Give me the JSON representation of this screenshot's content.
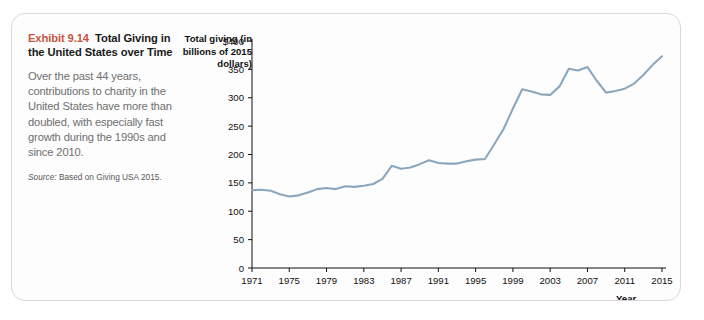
{
  "exhibit": {
    "number": "Exhibit 9.14",
    "title": "Total Giving in the United States over Time",
    "description": "Over the past 44 years, contributions to charity in the United States have more than doubled, with especially fast growth during the 1990s and since 2010.",
    "source_label": "Source:",
    "source_text": " Based on Giving USA 2015."
  },
  "axis_titles": {
    "y": "Total giving (in billions of 2015 dollars)",
    "x": "Year"
  },
  "bleed_text": [
    "9.7 Common Pool Resource Goods"
  ],
  "chart_data": {
    "type": "line",
    "title": "Total Giving in the United States over Time",
    "xlabel": "Year",
    "ylabel": "Total giving (in billions of 2015 dollars)",
    "xlim": [
      1971,
      2015
    ],
    "ylim": [
      0,
      400
    ],
    "ytick_labels": [
      "$400",
      "350",
      "300",
      "250",
      "200",
      "150",
      "100",
      "50",
      "0"
    ],
    "yticks": [
      400,
      350,
      300,
      250,
      200,
      150,
      100,
      50,
      0
    ],
    "xticks": [
      1971,
      1975,
      1979,
      1983,
      1987,
      1991,
      1995,
      1999,
      2003,
      2007,
      2011,
      2015
    ],
    "grid": false,
    "legend": false,
    "line_color": "#8ba6bd",
    "series": [
      {
        "name": "Total giving",
        "x": [
          1971,
          1972,
          1973,
          1974,
          1975,
          1976,
          1977,
          1978,
          1979,
          1980,
          1981,
          1982,
          1983,
          1984,
          1985,
          1986,
          1987,
          1988,
          1989,
          1990,
          1991,
          1992,
          1993,
          1994,
          1995,
          1996,
          1997,
          1998,
          1999,
          2000,
          2001,
          2002,
          2003,
          2004,
          2005,
          2006,
          2007,
          2008,
          2009,
          2010,
          2011,
          2012,
          2013,
          2014,
          2015
        ],
        "values": [
          137,
          138,
          136,
          130,
          126,
          128,
          133,
          139,
          141,
          139,
          144,
          143,
          145,
          148,
          157,
          180,
          175,
          177,
          183,
          190,
          185,
          184,
          184,
          188,
          191,
          192,
          218,
          245,
          281,
          315,
          311,
          306,
          305,
          320,
          351,
          348,
          354,
          330,
          309,
          312,
          316,
          325,
          340,
          358,
          373
        ]
      }
    ]
  }
}
